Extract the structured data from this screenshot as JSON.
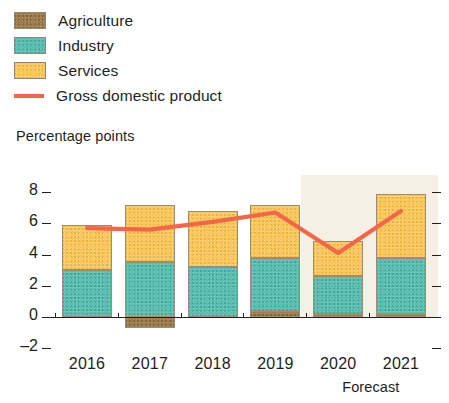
{
  "legend": {
    "items": [
      {
        "label": "Agriculture",
        "key": "agriculture",
        "color": "#9e7d4e",
        "type": "swatch"
      },
      {
        "label": "Industry",
        "key": "industry",
        "color": "#5cbdb0",
        "type": "swatch"
      },
      {
        "label": "Services",
        "key": "services",
        "color": "#f8c760",
        "type": "swatch"
      },
      {
        "label": "Gross domestic product",
        "key": "gdp",
        "color": "#f4664a",
        "type": "line"
      }
    ]
  },
  "axis": {
    "y_title": "Percentage points",
    "y_ticks": [
      "8",
      "6",
      "4",
      "2",
      "0",
      "–2"
    ],
    "x_ticks": [
      "2016",
      "2017",
      "2018",
      "2019",
      "2020",
      "2021"
    ]
  },
  "annotation": {
    "forecast_label": "Forecast"
  },
  "chart_data": {
    "type": "bar",
    "title": "",
    "subtitle": "",
    "xlabel": "",
    "ylabel": "Percentage points",
    "ylim": [
      -2,
      8
    ],
    "ytick_values": [
      8,
      6,
      4,
      2,
      0,
      -2
    ],
    "grid": false,
    "legend_position": "top-left",
    "stacked": true,
    "categories": [
      "2016",
      "2017",
      "2018",
      "2019",
      "2020",
      "2021"
    ],
    "series": [
      {
        "name": "Agriculture",
        "color": "#9e7d4e",
        "values": [
          0.0,
          -0.7,
          0.0,
          0.4,
          0.2,
          0.2
        ]
      },
      {
        "name": "Industry",
        "color": "#5cbdb0",
        "values": [
          3.0,
          3.5,
          3.2,
          3.4,
          2.4,
          3.6
        ]
      },
      {
        "name": "Services",
        "color": "#f8c760",
        "values": [
          2.9,
          3.7,
          3.6,
          3.4,
          2.3,
          4.1
        ]
      }
    ],
    "overlay_series": [
      {
        "name": "Gross domestic product",
        "type": "line",
        "color": "#f4664a",
        "values": [
          5.7,
          5.6,
          6.1,
          6.7,
          4.1,
          6.8
        ]
      }
    ],
    "annotations": [
      {
        "text": "Forecast",
        "covers": [
          "2020",
          "2021"
        ],
        "kind": "shaded-band"
      }
    ]
  }
}
